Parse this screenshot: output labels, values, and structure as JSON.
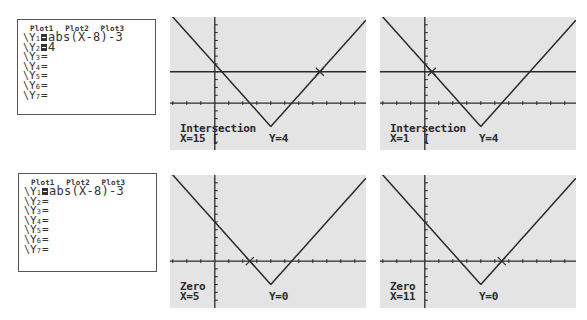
{
  "colors": {
    "screen_bg": "#e4e4e4",
    "ink": "#2a2a2a",
    "border": "#555555"
  },
  "window": {
    "xmin": -6.4,
    "xmax": 21.6,
    "ymin": -6,
    "ymax": 11,
    "xscl": 2,
    "yscl": 1
  },
  "yeq_screens": [
    {
      "plots": [
        "Plot1",
        "Plot2",
        "Plot3"
      ],
      "rows": [
        {
          "name": "Y",
          "sub": "1",
          "selected": true,
          "expr": "abs(X-8)-3"
        },
        {
          "name": "Y",
          "sub": "2",
          "selected": true,
          "expr": "4"
        },
        {
          "name": "Y",
          "sub": "3",
          "selected": false,
          "expr": ""
        },
        {
          "name": "Y",
          "sub": "4",
          "selected": false,
          "expr": ""
        },
        {
          "name": "Y",
          "sub": "5",
          "selected": false,
          "expr": ""
        },
        {
          "name": "Y",
          "sub": "6",
          "selected": false,
          "expr": ""
        },
        {
          "name": "Y",
          "sub": "7",
          "selected": false,
          "expr": ""
        }
      ]
    },
    {
      "plots": [
        "Plot1",
        "Plot2",
        "Plot3"
      ],
      "rows": [
        {
          "name": "Y",
          "sub": "1",
          "selected": true,
          "expr": "abs(X-8)-3"
        },
        {
          "name": "Y",
          "sub": "2",
          "selected": false,
          "expr": ""
        },
        {
          "name": "Y",
          "sub": "3",
          "selected": false,
          "expr": ""
        },
        {
          "name": "Y",
          "sub": "4",
          "selected": false,
          "expr": ""
        },
        {
          "name": "Y",
          "sub": "5",
          "selected": false,
          "expr": ""
        },
        {
          "name": "Y",
          "sub": "6",
          "selected": false,
          "expr": ""
        },
        {
          "name": "Y",
          "sub": "7",
          "selected": false,
          "expr": ""
        }
      ]
    }
  ],
  "graph_screens": [
    {
      "mode": "Intersection",
      "x_label": "X=15",
      "y_label": "Y=4",
      "functions": [
        "abs(X-8)-3",
        "4"
      ],
      "marker": {
        "x": 15,
        "y": 4
      }
    },
    {
      "mode": "Intersection",
      "x_label": "X=1",
      "y_label": "Y=4",
      "functions": [
        "abs(X-8)-3",
        "4"
      ],
      "marker": {
        "x": 1,
        "y": 4
      }
    },
    {
      "mode": "Zero",
      "x_label": "X=5",
      "y_label": "Y=0",
      "functions": [
        "abs(X-8)-3"
      ],
      "marker": {
        "x": 5,
        "y": 0
      }
    },
    {
      "mode": "Zero",
      "x_label": "X=11",
      "y_label": "Y=0",
      "functions": [
        "abs(X-8)-3"
      ],
      "marker": {
        "x": 11,
        "y": 0
      }
    }
  ],
  "labels": {
    "eq_sign": "=",
    "slash": "\\",
    "cursor_bracket": "["
  }
}
